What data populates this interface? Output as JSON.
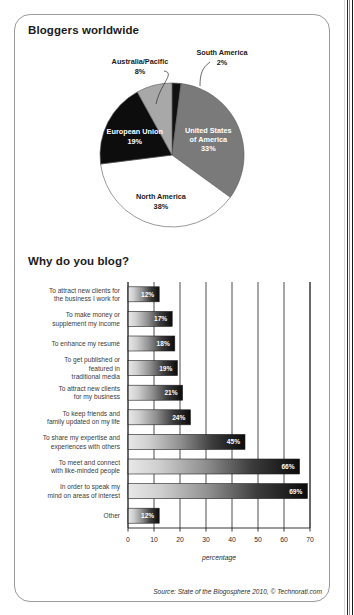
{
  "document": {
    "source_note": "Source: State of the Blogosphere 2010, © Technorati.com"
  },
  "pie_section": {
    "title": "Bloggers worldwide"
  },
  "bar_section": {
    "title": "Why do you blog?"
  },
  "chart_data": [
    {
      "type": "pie",
      "title": "Bloggers worldwide",
      "start_angle_deg": 0,
      "direction": "clockwise",
      "labels": [
        "South America",
        "United States of America",
        "North America",
        "European Union",
        "Australia/Pacific"
      ],
      "values": [
        2,
        33,
        38,
        19,
        8
      ],
      "value_suffix": "%",
      "display_values": [
        "2%",
        "33%",
        "38%",
        "19%",
        "8%"
      ],
      "colors": [
        "#111111",
        "#7a7a7a",
        "#ffffff",
        "#0d0d0d",
        "#a8a8a8"
      ],
      "label_placement": [
        "callout",
        "inside",
        "outside",
        "inside",
        "callout"
      ],
      "legend": "none"
    },
    {
      "type": "bar",
      "orientation": "horizontal",
      "title": "Why do you blog?",
      "xlabel": "percentage",
      "ylabel": "",
      "xlim": [
        0,
        70
      ],
      "xticks": [
        0,
        10,
        20,
        30,
        40,
        50,
        60,
        70
      ],
      "xtick_labels": [
        "0",
        "10",
        "20",
        "30",
        "40",
        "50",
        "60",
        "70"
      ],
      "grid": true,
      "legend": "none",
      "bar_fill": "gradient light-gray to black, left to right",
      "categories": [
        "To attract new clients for the business I work for",
        "To make money or supplement my income",
        "To enhance my resumé",
        "To get published or featured in traditional media",
        "To attract new clients for my business",
        "To keep friends and family updated on my life",
        "To share my expertise and experiences with others",
        "To meet and connect with like-minded people",
        "In order to speak my mind on areas of interest",
        "Other"
      ],
      "category_lines": [
        [
          "To attract new clients for",
          "the business I work for"
        ],
        [
          "To make money or",
          "supplement my income"
        ],
        [
          "To enhance my resumé"
        ],
        [
          "To get published or",
          "featured in",
          "traditional media"
        ],
        [
          "To attract new clients",
          "for my business"
        ],
        [
          "To keep friends and",
          "family updated on my life"
        ],
        [
          "To share my expertise and",
          "experiences with others"
        ],
        [
          "To meet and connect",
          "with like-minded people"
        ],
        [
          "In order to speak my",
          "mind on areas of interest"
        ],
        [
          "Other"
        ]
      ],
      "values": [
        12,
        17,
        18,
        19,
        21,
        24,
        45,
        66,
        69,
        12
      ],
      "display_values": [
        "12%",
        "17%",
        "18%",
        "19%",
        "21%",
        "24%",
        "45%",
        "66%",
        "69%",
        "12%"
      ]
    }
  ]
}
